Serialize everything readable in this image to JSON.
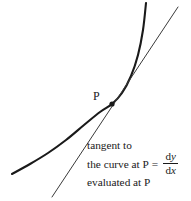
{
  "figure": {
    "background_color": "#ffffff",
    "stroke_color": "#1a1a1a",
    "point_label": "P",
    "caption": {
      "line1": "tangent to",
      "line2_text": "the curve at P",
      "equals": "=",
      "line3": "evaluated at P",
      "fraction": {
        "numerator_d": "d",
        "numerator_var": "y",
        "denominator_d": "d",
        "denominator_var": "x"
      }
    }
  },
  "chart_data": {
    "type": "line",
    "title": "",
    "xlabel": "",
    "ylabel": "",
    "grid": false,
    "legend": "none",
    "annotations": [
      {
        "text": "P",
        "x": 112,
        "y": 104,
        "role": "point-of-tangency"
      },
      {
        "text": "tangent to the curve at P = dy/dx evaluated at P",
        "x": 87,
        "y": 139,
        "role": "caption"
      }
    ],
    "series": [
      {
        "name": "curve",
        "role": "exponential-curve",
        "stroke_width": 2.1,
        "points": [
          [
            12,
            174
          ],
          [
            30,
            164
          ],
          [
            48,
            153
          ],
          [
            66,
            140
          ],
          [
            84,
            125
          ],
          [
            100,
            112
          ],
          [
            112,
            104
          ],
          [
            122,
            93
          ],
          [
            131,
            76
          ],
          [
            138,
            55
          ],
          [
            143,
            30
          ],
          [
            146,
            3
          ]
        ]
      },
      {
        "name": "tangent-line",
        "role": "tangent-at-P",
        "stroke_width": 1.0,
        "points": [
          [
            52,
            197
          ],
          [
            112,
            104
          ],
          [
            178,
            7
          ]
        ]
      }
    ],
    "point_marker": {
      "x": 112,
      "y": 104,
      "r": 2.6
    }
  }
}
